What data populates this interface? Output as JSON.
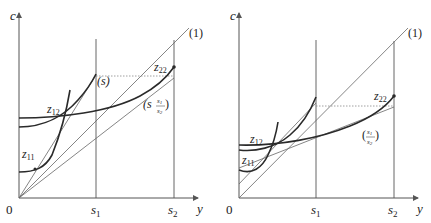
{
  "panels": [
    {
      "id": "left",
      "axes": {
        "y_label": "c",
        "x_label": "y",
        "origin_label": "0"
      },
      "ticks": {
        "s1": "s",
        "s1_sub": "1",
        "s2": "s",
        "s2_sub": "2"
      },
      "lines": {
        "line_1": "(1)",
        "line_s": "(s)",
        "line_s_ratio_prefix": "(s",
        "line_s_ratio_num": "s1",
        "line_s_ratio_den": "s2",
        "line_s_ratio_suffix": ")"
      },
      "points": {
        "z11": {
          "main": "z",
          "sub": "11"
        },
        "z12": {
          "main": "z",
          "sub": "12"
        },
        "z22": {
          "main": "z",
          "sub": "22"
        }
      }
    },
    {
      "id": "right",
      "axes": {
        "y_label": "c",
        "x_label": "y",
        "origin_label": "0"
      },
      "ticks": {
        "s1": "s",
        "s1_sub": "1",
        "s2": "s",
        "s2_sub": "2"
      },
      "lines": {
        "line_1": "(1)",
        "line_ratio_prefix": "(",
        "line_ratio_num": "s1",
        "line_ratio_den": "s2",
        "line_ratio_suffix": ")"
      },
      "points": {
        "z11": {
          "main": "z",
          "sub": "11"
        },
        "z12": {
          "main": "z",
          "sub": "12"
        },
        "z22": {
          "main": "z",
          "sub": "22"
        }
      }
    }
  ],
  "colors": {
    "axis": "#555555",
    "thin_line": "#666666",
    "curve": "#2a2a2a",
    "dotted": "#888888"
  }
}
